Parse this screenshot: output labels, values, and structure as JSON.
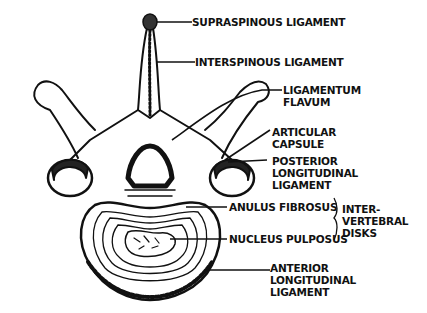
{
  "diagram": {
    "colors": {
      "ink": "#111111",
      "background": "#ffffff"
    },
    "labels": {
      "supraspinous": [
        "SUPRASPINOUS LIGAMENT"
      ],
      "interspinous": [
        "INTERSPINOUS LIGAMENT"
      ],
      "flavum": [
        "LIGAMENTUM",
        "FLAVUM"
      ],
      "capsule": [
        "ARTICULAR",
        "CAPSULE"
      ],
      "posterior": [
        "POSTERIOR",
        "LONGITUDINAL",
        "LIGAMENT"
      ],
      "anulus": [
        "ANULUS FIBROSUS"
      ],
      "nucleus": [
        "NUCLEUS PULPOSUS"
      ],
      "disks_group": [
        "INTER-",
        "VERTEBRAL",
        "DISKS"
      ],
      "anterior": [
        "ANTERIOR",
        "LONGITUDINAL",
        "LIGAMENT"
      ]
    }
  }
}
